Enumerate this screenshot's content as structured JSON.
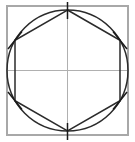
{
  "figure": {
    "title": "Regular hexagon inscribed in a circle within a square with center crosshair axes",
    "canvas": {
      "width": 135,
      "height": 142,
      "background": "#ffffff"
    },
    "colors": {
      "frame": "#a8a8a8",
      "axis": "#b0b0b0",
      "circle": "#2b2b2b",
      "hexagon": "#2b2b2b",
      "tick": "#1a1a1a"
    },
    "stroke_widths": {
      "frame": 1.1,
      "axis": 1.0,
      "circle": 1.5,
      "hexagon": 1.5,
      "tick": 1.5
    }
  },
  "shapes": {
    "square": {
      "name": "bounding-square",
      "x": 7,
      "y": 6,
      "width": 121,
      "height": 129
    },
    "axes": {
      "name": "center-crosshair",
      "center_x": 67.5,
      "center_y": 70.5,
      "horizontal": {
        "x1": 7,
        "y1": 70.5,
        "x2": 128,
        "y2": 70.5
      },
      "vertical": {
        "x1": 67.5,
        "y1": 6,
        "x2": 67.5,
        "y2": 135
      }
    },
    "circle": {
      "name": "circumscribed-circle",
      "cx": 67.5,
      "cy": 70.5,
      "rx": 60.5,
      "ry": 60.5
    },
    "hexagon": {
      "name": "inscribed-hexagon",
      "sides": 6,
      "orientation": "pointy-top",
      "points": "67.5,10 120.0,40.3 120.0,100.7 67.5,131 15.0,100.7 15.0,40.3",
      "vertices": [
        {
          "label": "top",
          "x": 67.5,
          "y": 10,
          "tick_angle_deg": 90
        },
        {
          "label": "upper-right",
          "x": 120.0,
          "y": 40.3,
          "tick_angle_deg": 30
        },
        {
          "label": "lower-right",
          "x": 120.0,
          "y": 100.7,
          "tick_angle_deg": -30
        },
        {
          "label": "bottom",
          "x": 67.5,
          "y": 131,
          "tick_angle_deg": -90
        },
        {
          "label": "lower-left",
          "x": 15.0,
          "y": 100.7,
          "tick_angle_deg": 210
        },
        {
          "label": "upper-left",
          "x": 15.0,
          "y": 40.3,
          "tick_angle_deg": 150
        }
      ]
    },
    "tick_marks": {
      "name": "vertex-tick-marks",
      "count": 6,
      "length": 17,
      "segments": [
        {
          "x1": 67.5,
          "y1": 2,
          "x2": 67.5,
          "y2": 19
        },
        {
          "x1": 113.0,
          "y1": 31.5,
          "x2": 127.0,
          "y2": 49.0
        },
        {
          "x1": 113.0,
          "y1": 109.5,
          "x2": 127.0,
          "y2": 92.0
        },
        {
          "x1": 67.5,
          "y1": 123,
          "x2": 67.5,
          "y2": 140
        },
        {
          "x1": 8.0,
          "y1": 92.0,
          "x2": 22.0,
          "y2": 109.5
        },
        {
          "x1": 8.0,
          "y1": 49.0,
          "x2": 22.0,
          "y2": 31.5
        }
      ]
    }
  }
}
